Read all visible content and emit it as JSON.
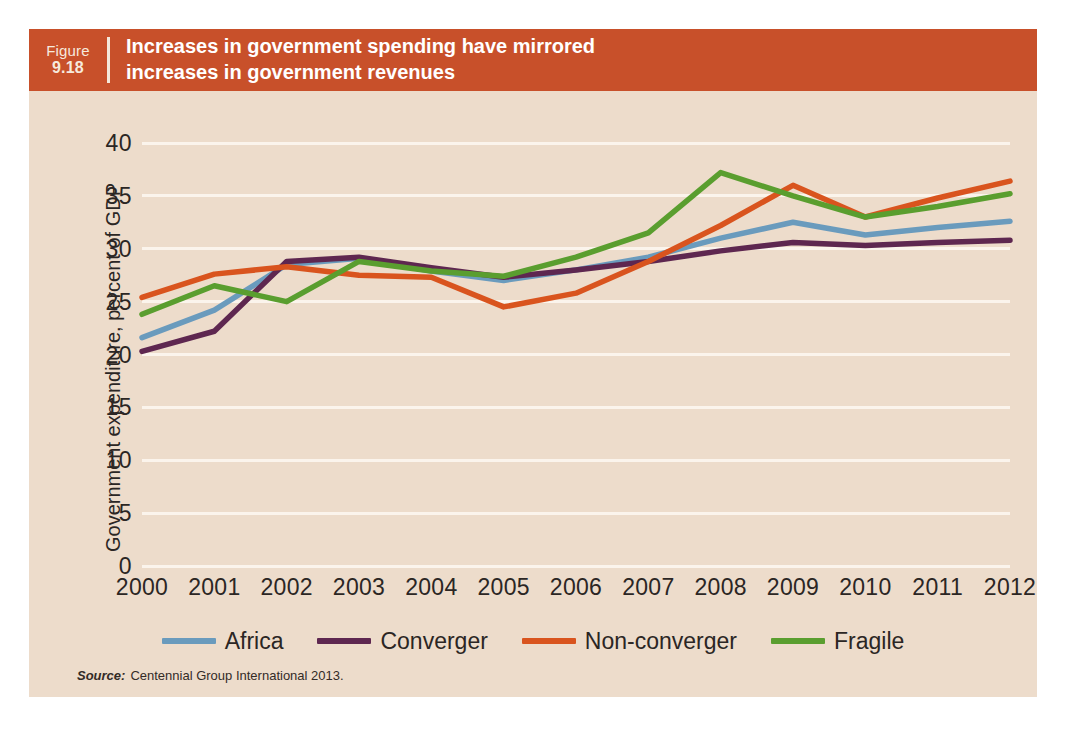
{
  "figure": {
    "label_word": "Figure",
    "number": "9.18",
    "title_line1": "Increases in government spending have mirrored",
    "title_line2": "increases in government revenues",
    "header_color": "#c8502a",
    "card_background": "#eddccb"
  },
  "source": {
    "label": "Source:",
    "text": "Centennial Group International 2013."
  },
  "chart_data": {
    "type": "line",
    "title": "Increases in government spending have mirrored increases in government revenues",
    "xlabel": "",
    "ylabel": "Government expenditure, percent of GDP",
    "categories": [
      "2000",
      "2001",
      "2002",
      "2003",
      "2004",
      "2005",
      "2006",
      "2007",
      "2008",
      "2009",
      "2010",
      "2011",
      "2012"
    ],
    "x": [
      2000,
      2001,
      2002,
      2003,
      2004,
      2005,
      2006,
      2007,
      2008,
      2009,
      2010,
      2011,
      2012
    ],
    "ylim": [
      0,
      40
    ],
    "yticks": [
      0,
      5,
      10,
      15,
      20,
      25,
      30,
      35,
      40
    ],
    "ytick_labels": [
      "0",
      "5",
      "10",
      "15",
      "20",
      "25",
      "30",
      "35",
      "40"
    ],
    "grid": true,
    "grid_color": "#fbf4ec",
    "legend_position": "bottom",
    "series": [
      {
        "name": "Africa",
        "color": "#6a9bbd",
        "values": [
          21.6,
          24.2,
          28.5,
          29.1,
          27.9,
          27.0,
          28.0,
          29.2,
          31.0,
          32.5,
          31.3,
          32.0,
          32.6
        ]
      },
      {
        "name": "Converger",
        "color": "#5e2750",
        "values": [
          20.3,
          22.2,
          28.8,
          29.2,
          28.2,
          27.3,
          28.0,
          28.8,
          29.8,
          30.6,
          30.3,
          30.6,
          30.8
        ]
      },
      {
        "name": "Non-converger",
        "color": "#d9541e",
        "values": [
          25.4,
          27.6,
          28.3,
          27.5,
          27.3,
          24.5,
          25.8,
          28.8,
          32.2,
          36.0,
          33.0,
          34.8,
          36.4
        ]
      },
      {
        "name": "Fragile",
        "color": "#5a9e2f",
        "values": [
          23.8,
          26.5,
          25.0,
          28.8,
          27.9,
          27.4,
          29.2,
          31.5,
          37.2,
          35.0,
          33.0,
          34.0,
          35.2
        ]
      }
    ]
  }
}
